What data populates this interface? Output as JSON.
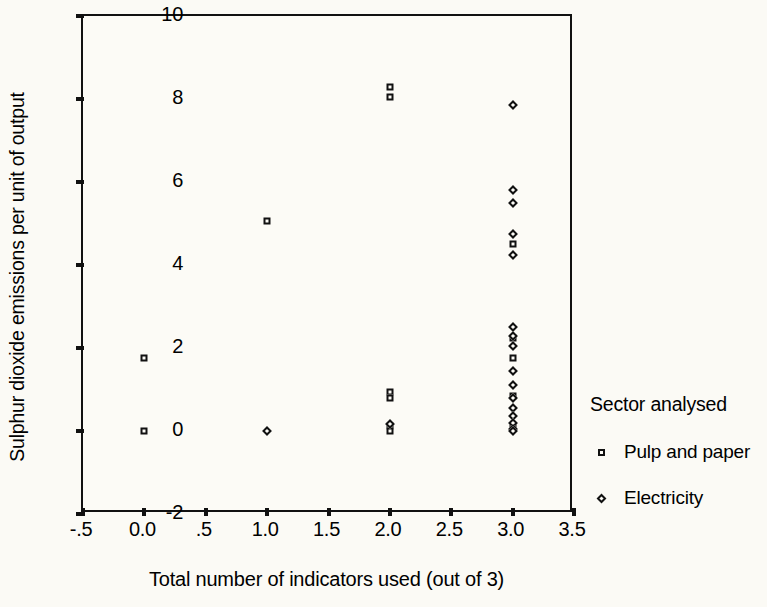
{
  "chart_data": {
    "type": "scatter",
    "title": "",
    "xlabel": "Total number of indicators used (out of 3)",
    "ylabel": "Sulphur dioxide emissions per unit of output",
    "xlim": [
      -0.5,
      3.5
    ],
    "ylim": [
      -2,
      10
    ],
    "grid": false,
    "legend_position": "right",
    "legend_title": "Sector analysed",
    "xticks": [
      -0.5,
      0.0,
      0.5,
      1.0,
      1.5,
      2.0,
      2.5,
      3.0,
      3.5
    ],
    "xticklabels": [
      "-.5",
      "0.0",
      ".5",
      "1.0",
      "1.5",
      "2.0",
      "2.5",
      "3.0",
      "3.5"
    ],
    "yticks": [
      -2,
      0,
      2,
      4,
      6,
      8,
      10
    ],
    "yticklabels": [
      "-2",
      "0",
      "2",
      "4",
      "6",
      "8",
      "10"
    ],
    "series": [
      {
        "name": "Pulp and paper",
        "marker": "square",
        "points": [
          {
            "x": 0.0,
            "y": 1.75
          },
          {
            "x": 0.0,
            "y": 0.0
          },
          {
            "x": 1.0,
            "y": 5.05
          },
          {
            "x": 2.0,
            "y": 8.3
          },
          {
            "x": 2.0,
            "y": 8.05
          },
          {
            "x": 2.0,
            "y": 0.95
          },
          {
            "x": 2.0,
            "y": 0.8
          },
          {
            "x": 2.0,
            "y": 0.12
          },
          {
            "x": 2.0,
            "y": 0.0
          },
          {
            "x": 3.0,
            "y": 4.5
          },
          {
            "x": 3.0,
            "y": 2.25
          },
          {
            "x": 3.0,
            "y": 1.75
          },
          {
            "x": 3.0,
            "y": 0.85
          },
          {
            "x": 3.0,
            "y": 0.1
          }
        ]
      },
      {
        "name": "Electricity",
        "marker": "diamond",
        "points": [
          {
            "x": 1.0,
            "y": 0.0
          },
          {
            "x": 2.0,
            "y": 0.18
          },
          {
            "x": 3.0,
            "y": 7.85
          },
          {
            "x": 3.0,
            "y": 5.8
          },
          {
            "x": 3.0,
            "y": 5.5
          },
          {
            "x": 3.0,
            "y": 4.75
          },
          {
            "x": 3.0,
            "y": 4.25
          },
          {
            "x": 3.0,
            "y": 2.5
          },
          {
            "x": 3.0,
            "y": 2.3
          },
          {
            "x": 3.0,
            "y": 2.05
          },
          {
            "x": 3.0,
            "y": 1.45
          },
          {
            "x": 3.0,
            "y": 1.1
          },
          {
            "x": 3.0,
            "y": 0.8
          },
          {
            "x": 3.0,
            "y": 0.55
          },
          {
            "x": 3.0,
            "y": 0.35
          },
          {
            "x": 3.0,
            "y": 0.2
          },
          {
            "x": 3.0,
            "y": 0.05
          },
          {
            "x": 3.0,
            "y": 0.0
          }
        ]
      }
    ]
  },
  "legend": {
    "title": "Sector analysed",
    "entries": [
      {
        "label": "Pulp and paper",
        "marker": "square"
      },
      {
        "label": "Electricity",
        "marker": "diamond"
      }
    ]
  }
}
